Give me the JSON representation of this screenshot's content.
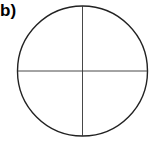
{
  "panel_label": "b)",
  "diagram": {
    "type": "circle-with-crosshair",
    "circle": {
      "cx": 82.5,
      "cy": 71,
      "r": 65,
      "stroke": "#222222",
      "stroke_width": 1.4
    },
    "lines": [
      {
        "name": "vertical-diameter",
        "x1": 82.5,
        "y1": 6,
        "x2": 82.5,
        "y2": 136,
        "stroke": "#333333"
      },
      {
        "name": "horizontal-diameter",
        "x1": 17.5,
        "y1": 71,
        "x2": 147.5,
        "y2": 71,
        "stroke": "#333333"
      }
    ]
  }
}
